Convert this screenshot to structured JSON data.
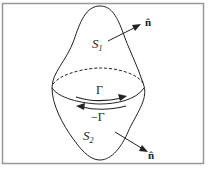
{
  "diagram": {
    "surface_top_label": "S",
    "surface_top_subscript": "1",
    "surface_bottom_label": "S",
    "surface_bottom_subscript": "2",
    "normal_top_label": "n̂",
    "normal_bottom_label": "n̂",
    "contour_top_label": "Γ",
    "contour_bottom_label": "−Γ",
    "colors": {
      "stroke": "#222222",
      "frame": "#999999",
      "background": "#ffffff"
    }
  }
}
